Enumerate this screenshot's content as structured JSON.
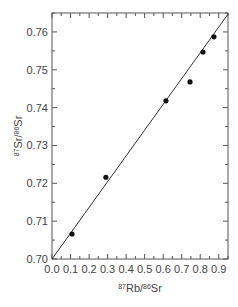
{
  "chart_data": {
    "type": "scatter",
    "title": "",
    "xlabel": "87Rb/86Sr",
    "ylabel": "87Sr/86Sr",
    "xlabel_parts": [
      {
        "sup": "87"
      },
      {
        "text": "Rb/"
      },
      {
        "sup": "86"
      },
      {
        "text": "Sr"
      }
    ],
    "ylabel_parts": [
      {
        "sup": "87"
      },
      {
        "text": "Sr/"
      },
      {
        "sup": "86"
      },
      {
        "text": "Sr"
      }
    ],
    "xlim": [
      0.0,
      0.95
    ],
    "ylim": [
      0.7,
      0.765
    ],
    "x_ticks": [
      0.0,
      0.1,
      0.2,
      0.3,
      0.4,
      0.5,
      0.6,
      0.7,
      0.8,
      0.9
    ],
    "x_tick_labels": [
      "0.0",
      "0.1",
      "0.2",
      "0.3",
      "0.4",
      "0.5",
      "0.6",
      "0.7",
      "0.8",
      "0.9"
    ],
    "x_minor_step": 0.05,
    "y_ticks": [
      0.7,
      0.71,
      0.72,
      0.73,
      0.74,
      0.75,
      0.76
    ],
    "y_tick_labels": [
      "0.70",
      "0.71",
      "0.72",
      "0.73",
      "0.74",
      "0.75",
      "0.76"
    ],
    "y_minor_step": 0.005,
    "grid": false,
    "legend": null,
    "series": [
      {
        "name": "samples",
        "kind": "points",
        "x": [
          0.108,
          0.291,
          0.615,
          0.745,
          0.815,
          0.874
        ],
        "y": [
          0.7066,
          0.7216,
          0.7418,
          0.7468,
          0.7547,
          0.7587
        ]
      },
      {
        "name": "isochron",
        "kind": "line",
        "x": [
          0.0,
          0.95
        ],
        "y": [
          0.7,
          0.7647
        ]
      }
    ]
  }
}
